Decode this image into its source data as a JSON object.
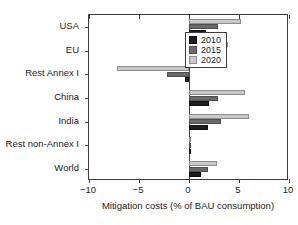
{
  "chart_data": {
    "type": "bar",
    "orientation": "horizontal",
    "title": "",
    "xlabel": "Mitigation costs (% of BAU consumption)",
    "ylabel": "",
    "xlim": [
      -10,
      10
    ],
    "xticks": [
      -10,
      -5,
      0,
      5,
      10
    ],
    "xticklabels": [
      "−10",
      "−5",
      "0",
      "5",
      "10"
    ],
    "grid": false,
    "legend_position": "upper left",
    "categories": [
      "USA",
      "EU",
      "Rest Annex I",
      "China",
      "India",
      "Rest non-Annex I",
      "World"
    ],
    "series": [
      {
        "name": "2010",
        "color": "#1c1c1c",
        "values": [
          1.7,
          1.3,
          -0.45,
          2.0,
          1.9,
          0.05,
          1.2
        ]
      },
      {
        "name": "2015",
        "color": "#6a6a6a",
        "values": [
          2.9,
          2.2,
          -2.2,
          2.9,
          3.2,
          0.1,
          1.9
        ]
      },
      {
        "name": "2020",
        "color": "#c9c9c9",
        "values": [
          5.2,
          3.9,
          -7.2,
          5.6,
          6.0,
          0.1,
          2.8
        ]
      }
    ]
  },
  "legend": {
    "entries": [
      {
        "label": "2010",
        "swatch": "dark-swatch"
      },
      {
        "label": "2015",
        "swatch": "mid-swatch"
      },
      {
        "label": "2020",
        "swatch": "light-swatch"
      }
    ]
  }
}
